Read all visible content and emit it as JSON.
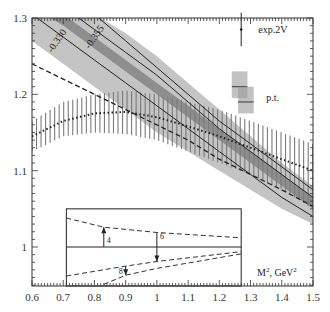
{
  "chart_data": {
    "type": "line",
    "title": "",
    "xlabel": "M^2, GeV^2",
    "ylabel": "",
    "xlim": [
      0.6,
      1.5
    ],
    "ylim": [
      0.949,
      1.3
    ],
    "xticks": [
      "0.6",
      "0.7",
      "0.8",
      "0.9",
      "1",
      "1.1",
      "1.2",
      "1.3",
      "1.4",
      "1.5"
    ],
    "yticks": [
      "1",
      "1.1",
      "1.2",
      "1.3"
    ],
    "grid": false,
    "series": [
      {
        "name": "light-gray-band",
        "kind": "band",
        "x": [
          0.6,
          0.7,
          0.8,
          0.9,
          1.0,
          1.1,
          1.2,
          1.3,
          1.4,
          1.5
        ],
        "upper": [
          1.345,
          1.325,
          1.305,
          1.28,
          1.25,
          1.215,
          1.18,
          1.145,
          1.11,
          1.08
        ],
        "lower": [
          1.27,
          1.24,
          1.21,
          1.18,
          1.15,
          1.125,
          1.1,
          1.075,
          1.05,
          1.03
        ]
      },
      {
        "name": "dark-gray-band",
        "kind": "band",
        "x": [
          0.6,
          0.7,
          0.8,
          0.9,
          1.0,
          1.1,
          1.2,
          1.3,
          1.4,
          1.5
        ],
        "upper": [
          1.33,
          1.305,
          1.275,
          1.245,
          1.215,
          1.185,
          1.155,
          1.125,
          1.095,
          1.065
        ],
        "lower": [
          1.315,
          1.29,
          1.26,
          1.23,
          1.2,
          1.17,
          1.14,
          1.11,
          1.08,
          1.05
        ]
      },
      {
        "name": "solid-line-upper",
        "kind": "solid",
        "label": "",
        "x": [
          0.6,
          0.7,
          0.8,
          0.9,
          1.0,
          1.1,
          1.2,
          1.3,
          1.4,
          1.5
        ],
        "values": [
          1.37,
          1.34,
          1.305,
          1.27,
          1.235,
          1.2,
          1.165,
          1.135,
          1.105,
          1.075
        ]
      },
      {
        "name": "solid-line-0355",
        "kind": "solid",
        "label": "-0.355",
        "x": [
          0.6,
          0.7,
          0.8,
          0.9,
          1.0,
          1.1,
          1.2,
          1.3,
          1.4,
          1.5
        ],
        "values": [
          1.345,
          1.315,
          1.285,
          1.255,
          1.225,
          1.19,
          1.155,
          1.125,
          1.095,
          1.065
        ]
      },
      {
        "name": "solid-line-0330",
        "kind": "solid",
        "label": "-0.330",
        "x": [
          0.6,
          0.7,
          0.8,
          0.9,
          1.0,
          1.1,
          1.2,
          1.3,
          1.4,
          1.5
        ],
        "values": [
          1.305,
          1.275,
          1.245,
          1.215,
          1.185,
          1.155,
          1.125,
          1.095,
          1.065,
          1.04
        ]
      },
      {
        "name": "dashed-line",
        "kind": "dashed",
        "x": [
          0.6,
          0.7,
          0.8,
          0.9,
          1.0,
          1.1,
          1.2,
          1.3,
          1.4,
          1.5
        ],
        "values": [
          1.24,
          1.22,
          1.2,
          1.18,
          1.16,
          1.14,
          1.115,
          1.095,
          1.075,
          1.053
        ]
      },
      {
        "name": "dotted-central-hatched",
        "kind": "dotted",
        "x": [
          0.6,
          0.7,
          0.8,
          0.9,
          1.0,
          1.1,
          1.2,
          1.3,
          1.4,
          1.5
        ],
        "values": [
          1.145,
          1.165,
          1.175,
          1.177,
          1.17,
          1.158,
          1.145,
          1.13,
          1.115,
          1.1
        ]
      },
      {
        "name": "hatched-band",
        "kind": "hatched",
        "x": [
          0.6,
          0.7,
          0.8,
          0.9,
          1.0,
          1.1,
          1.2,
          1.3,
          1.4,
          1.5
        ],
        "upper": [
          1.165,
          1.19,
          1.2,
          1.205,
          1.2,
          1.19,
          1.18,
          1.165,
          1.15,
          1.135
        ],
        "lower": [
          1.125,
          1.145,
          1.15,
          1.148,
          1.14,
          1.125,
          1.11,
          1.095,
          1.075,
          1.05
        ]
      }
    ],
    "legend": [
      {
        "label": "exp.2V",
        "symbol": "error-bar"
      },
      {
        "label": "p.t.",
        "symbol": "gray-boxes"
      }
    ],
    "annotations": [
      {
        "text": "-0.330",
        "at": [
          0.68,
          1.27
        ],
        "rotation": -55
      },
      {
        "text": "-0.355",
        "at": [
          0.8,
          1.275
        ],
        "rotation": -55
      }
    ],
    "exp_point": {
      "x": 1.27,
      "y": 1.285,
      "err": 0.022
    },
    "pt_boxes": [
      {
        "x0": 1.24,
        "x1": 1.29,
        "y0": 1.195,
        "y1": 1.23,
        "center": 1.21
      },
      {
        "x0": 1.26,
        "x1": 1.31,
        "y0": 1.175,
        "y1": 1.21,
        "center": 1.19
      }
    ],
    "inset": {
      "x_range": [
        0.71,
        1.27
      ],
      "y_top": 1.05,
      "y_mid": 1.0,
      "labels": [
        "4",
        "6",
        "8"
      ],
      "upper_dashed": [
        [
          0.71,
          1.038
        ],
        [
          0.83,
          1.026
        ],
        [
          1.0,
          1.019
        ],
        [
          1.27,
          1.012
        ]
      ],
      "lower_dashed_1": [
        [
          0.71,
          0.962
        ],
        [
          0.9,
          0.975
        ],
        [
          1.0,
          0.981
        ],
        [
          1.27,
          0.994
        ]
      ],
      "lower_dashed_2": [
        [
          0.83,
          0.951
        ],
        [
          0.9,
          0.963
        ],
        [
          1.0,
          0.972
        ],
        [
          1.27,
          0.991
        ]
      ],
      "arrows": [
        {
          "label": "4",
          "x": 0.83,
          "from": 1.0,
          "to": 1.026,
          "dir": "up"
        },
        {
          "label": "6",
          "x": 1.0,
          "from": 1.019,
          "to": 0.981,
          "dir": "down"
        },
        {
          "label": "8",
          "x": 0.9,
          "from": 0.975,
          "to": 0.963,
          "dir": "down"
        }
      ]
    }
  }
}
